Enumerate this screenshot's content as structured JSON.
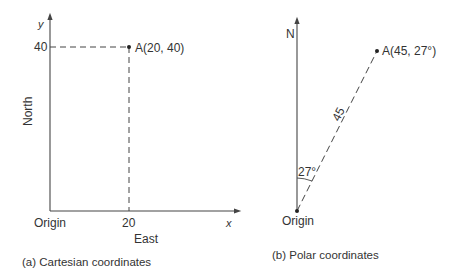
{
  "cartesian": {
    "y_axis_label": "y",
    "x_axis_label": "x",
    "y_tick": "40",
    "x_tick": "20",
    "origin_label": "Origin",
    "y_direction_label": "North",
    "x_direction_label": "East",
    "point_label": "A(20, 40)",
    "caption": "(a)  Cartesian coordinates"
  },
  "polar": {
    "axis_label": "N",
    "point_label": "A(45, 27°)",
    "distance_label": "45",
    "angle_label": "27°",
    "origin_label": "Origin",
    "caption": "(b)  Polar coordinates"
  },
  "colors": {
    "line": "#444444",
    "text": "#333333",
    "background": "#ffffff"
  }
}
